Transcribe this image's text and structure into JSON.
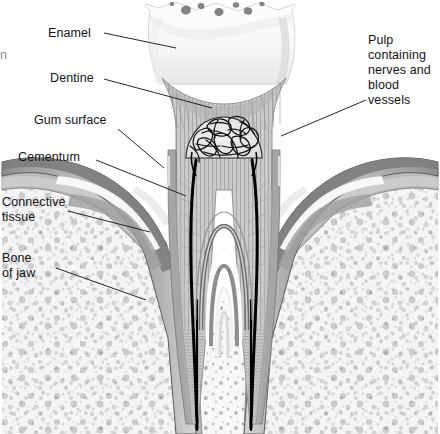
{
  "figure": {
    "background_color": "#ffffff",
    "width": 440,
    "height": 434,
    "label_color": "#141414",
    "leader_color": "#1a1a1a"
  },
  "labels": {
    "enamel": "Enamel",
    "dentine": "Dentine",
    "gum_surface": "Gum surface",
    "cementum": "Cementum",
    "connective_tissue_line1": "Connective",
    "connective_tissue_line2": "tissue",
    "bone_of_jaw_line1": "Bone",
    "bone_of_jaw_line2": "of jaw",
    "pulp_line1": "Pulp",
    "pulp_line2": "containing",
    "pulp_line3": "nerves and",
    "pulp_line4": "blood",
    "pulp_line5": "vessels",
    "clipped_edge_char": "n"
  },
  "structures": [
    {
      "name": "enamel",
      "label": "Enamel",
      "fill": "#f7f7f7",
      "stroke": "#cfcfcf",
      "description": "Hard white outer crown layer with occlusal fissures"
    },
    {
      "name": "dentine",
      "label": "Dentine",
      "fill": "#c9c9c9",
      "stroke": "#8f8f8f",
      "description": "Radially striated body of the tooth beneath enamel"
    },
    {
      "name": "pulp",
      "label": "Pulp containing nerves and blood vessels",
      "fill": "#e8e8e8",
      "stroke": "#111111",
      "description": "Central chamber with tangled nerves and blood vessels"
    },
    {
      "name": "root-canal",
      "label": "Root canal",
      "fill": "#000000",
      "stroke": "#000000",
      "description": "Dark narrow channels running down each root"
    },
    {
      "name": "gum-surface",
      "label": "Gum surface",
      "fill": "#9a9a9a",
      "stroke": "#5f5f5f",
      "description": "Outer gingival margin surrounding the tooth neck"
    },
    {
      "name": "cementum",
      "label": "Cementum",
      "fill": "#b4b4b4",
      "stroke": "#6a6a6a",
      "description": "Thin calcified layer coating the root surface"
    },
    {
      "name": "connective-tissue",
      "label": "Connective tissue",
      "fill": "#bdbdbd",
      "stroke": "#717171",
      "description": "Fibrous layer between gum and jaw bone"
    },
    {
      "name": "bone-of-jaw",
      "label": "Bone of jaw",
      "fill": "#efefef",
      "stroke": "#8a8a8a",
      "description": "Speckled spongy alveolar bone holding the roots"
    }
  ],
  "leaders": [
    {
      "name": "enamel-leader",
      "x1": 104,
      "y1": 33,
      "x2": 176,
      "y2": 48
    },
    {
      "name": "dentine-leader",
      "x1": 104,
      "y1": 79,
      "x2": 212,
      "y2": 108
    },
    {
      "name": "gum-surface-leader",
      "x1": 118,
      "y1": 129,
      "x2": 164,
      "y2": 168
    },
    {
      "name": "cementum-leader",
      "x1": 96,
      "y1": 160,
      "x2": 186,
      "y2": 196
    },
    {
      "name": "connective-tissue-leader",
      "x1": 68,
      "y1": 211,
      "x2": 150,
      "y2": 232
    },
    {
      "name": "bone-of-jaw-leader",
      "x1": 56,
      "y1": 268,
      "x2": 146,
      "y2": 300
    },
    {
      "name": "pulp-leader",
      "x1": 366,
      "y1": 100,
      "x2": 281,
      "y2": 136
    }
  ]
}
